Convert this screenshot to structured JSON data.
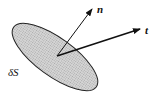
{
  "diagram": {
    "surface": {
      "label": "δS",
      "fill": "#c8c8c8",
      "stroke": "#222222"
    },
    "vectors": [
      {
        "label": "n",
        "meaning": "normal vector"
      },
      {
        "label": "t",
        "meaning": "traction/tangent vector"
      }
    ]
  }
}
